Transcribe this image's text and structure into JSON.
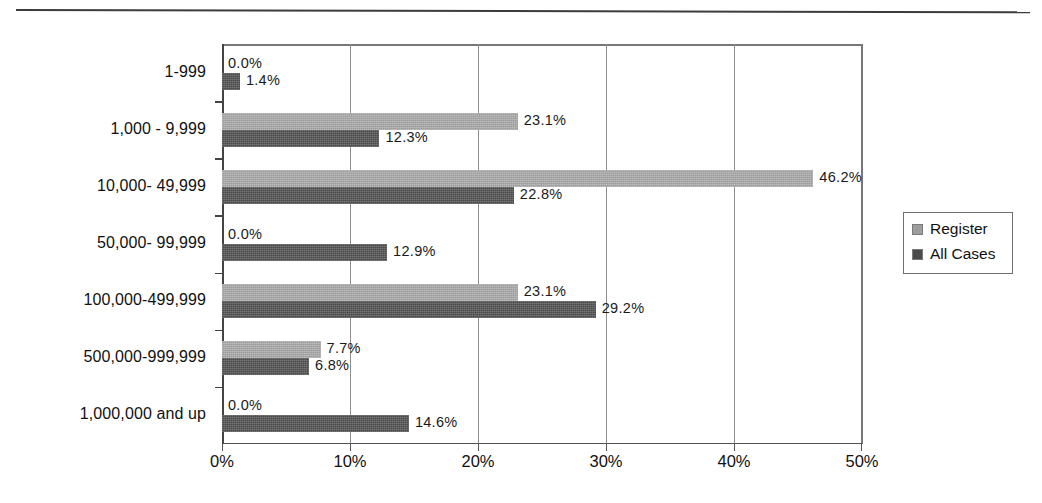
{
  "chart_data": {
    "type": "bar",
    "orientation": "horizontal",
    "title": "",
    "xlabel": "",
    "ylabel": "",
    "xlim": [
      0,
      50
    ],
    "xtick_labels": [
      "0%",
      "10%",
      "20%",
      "30%",
      "40%",
      "50%"
    ],
    "xticks": [
      0,
      10,
      20,
      30,
      40,
      50
    ],
    "grid": true,
    "grid_axis": "x",
    "legend_position": "right",
    "categories": [
      "1-999",
      "1,000 - 9,999",
      "10,000- 49,999",
      "50,000- 99,999",
      "100,000-499,999",
      "500,000-999,999",
      "1,000,000 and up"
    ],
    "series": [
      {
        "name": "Register",
        "color": "#9d9d9d",
        "values": [
          0.0,
          23.1,
          46.2,
          0.0,
          23.1,
          7.7,
          0.0
        ],
        "labels": [
          "0.0%",
          "23.1%",
          "46.2%",
          "0.0%",
          "23.1%",
          "7.7%",
          "0.0%"
        ]
      },
      {
        "name": "All Cases",
        "color": "#4b4b4b",
        "values": [
          1.4,
          12.3,
          22.8,
          12.9,
          29.2,
          6.8,
          14.6
        ],
        "labels": [
          "1.4%",
          "12.3%",
          "22.8%",
          "12.9%",
          "29.2%",
          "6.8%",
          "14.6%"
        ]
      }
    ]
  },
  "legend": {
    "entries": [
      {
        "label": "Register",
        "color": "#9d9d9d"
      },
      {
        "label": "All Cases",
        "color": "#4b4b4b"
      }
    ]
  }
}
